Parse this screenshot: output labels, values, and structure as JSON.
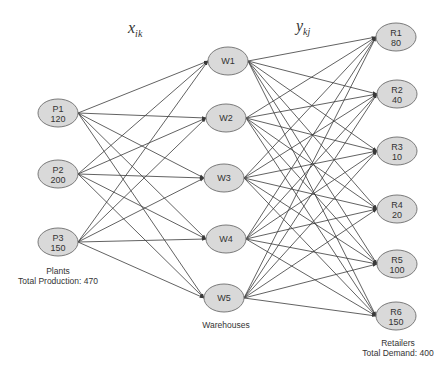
{
  "labels": {
    "x_var": "x",
    "x_sub": "ik",
    "y_var": "y",
    "y_sub": "kj"
  },
  "plants": {
    "caption": "Plants",
    "total_caption": "Total Production:  470",
    "nodes": [
      {
        "id": "P1",
        "value": "120",
        "cx": 58,
        "cy": 113
      },
      {
        "id": "P2",
        "value": "200",
        "cx": 58,
        "cy": 174
      },
      {
        "id": "P3",
        "value": "150",
        "cx": 58,
        "cy": 242
      }
    ]
  },
  "warehouses": {
    "caption": "Warehouses",
    "nodes": [
      {
        "id": "W1",
        "cx": 228,
        "cy": 61
      },
      {
        "id": "W2",
        "cx": 226,
        "cy": 118
      },
      {
        "id": "W3",
        "cx": 224,
        "cy": 178
      },
      {
        "id": "W4",
        "cx": 226,
        "cy": 239
      },
      {
        "id": "W5",
        "cx": 224,
        "cy": 298
      }
    ]
  },
  "retailers": {
    "caption": "Retailers",
    "total_caption": "Total Demand:  400",
    "nodes": [
      {
        "id": "R1",
        "value": "80",
        "cx": 396,
        "cy": 37
      },
      {
        "id": "R2",
        "value": "40",
        "cx": 397,
        "cy": 94
      },
      {
        "id": "R3",
        "value": "10",
        "cx": 397,
        "cy": 151
      },
      {
        "id": "R4",
        "value": "20",
        "cx": 397,
        "cy": 209
      },
      {
        "id": "R5",
        "value": "100",
        "cx": 397,
        "cy": 264
      },
      {
        "id": "R6",
        "value": "150",
        "cx": 396,
        "cy": 316
      }
    ]
  },
  "colors": {
    "node_fill": "#d9d9d9",
    "node_stroke": "#7a7a7a",
    "edge": "#3a3a3a",
    "text": "#333333"
  }
}
